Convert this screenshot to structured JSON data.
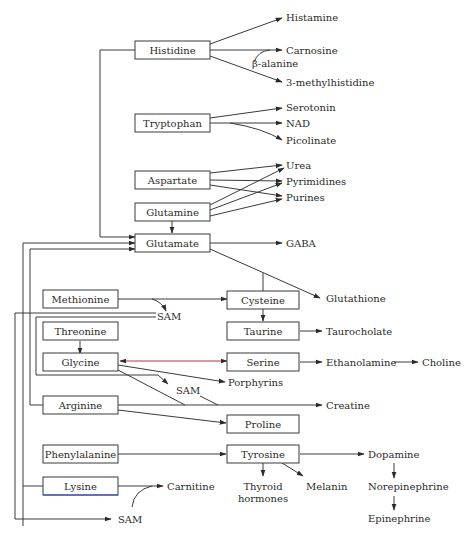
{
  "diagram": {
    "amino_acids": {
      "histidine": "Histidine",
      "tryptophan": "Tryptophan",
      "aspartate": "Aspartate",
      "glutamine": "Glutamine",
      "glutamate": "Glutamate",
      "methionine": "Methionine",
      "cysteine": "Cysteine",
      "threonine": "Threonine",
      "taurine": "Taurine",
      "glycine": "Glycine",
      "serine": "Serine",
      "arginine": "Arginine",
      "proline": "Proline",
      "phenylalanine": "Phenylalanine",
      "tyrosine": "Tyrosine",
      "lysine": "Lysine"
    },
    "products": {
      "histamine": "Histamine",
      "carnosine": "Carnosine",
      "beta_alanine": "β-alanine",
      "methylhistidine": "3-methylhistidine",
      "serotonin": "Serotonin",
      "nad": "NAD",
      "picolinate": "Picolinate",
      "urea": "Urea",
      "pyrimidines": "Pyrimidines",
      "purines": "Purines",
      "gaba": "GABA",
      "glutathione": "Glutathione",
      "sam_methionine": "SAM",
      "taurocholate": "Taurocholate",
      "ethanolamine": "Ethanolamine",
      "choline": "Choline",
      "porphyrins": "Porphyrins",
      "sam_glycine": "SAM",
      "creatine": "Creatine",
      "dopamine": "Dopamine",
      "norepinephrine": "Norepinephrine",
      "epinephrine": "Epinephrine",
      "thyroid_line1": "Thyroid",
      "thyroid_line2": "hormones",
      "melanin": "Melanin",
      "carnitine": "Carnitine",
      "sam_lysine": "SAM"
    },
    "colors": {
      "line": "#3a3a3a",
      "glycine_serine_arrow": "#c0303a",
      "lysine_underline": "#3344cc"
    }
  }
}
